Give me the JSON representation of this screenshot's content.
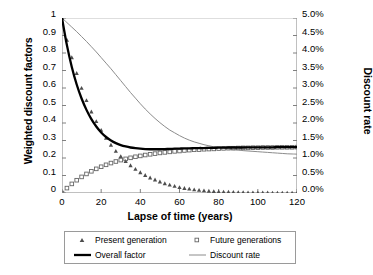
{
  "chart_data": {
    "type": "line",
    "title": "",
    "xlabel": "Lapse of time (years)",
    "ylabel": "Weighted discount factors",
    "y2label": "Discount rate",
    "xlim": [
      0,
      120
    ],
    "ylim": [
      0,
      1
    ],
    "y2lim": [
      0,
      5
    ],
    "grid": false,
    "legend_position": "bottom",
    "xticks": [
      "0",
      "20",
      "40",
      "60",
      "80",
      "100",
      "120"
    ],
    "xtick_values": [
      0,
      20,
      40,
      60,
      80,
      100,
      120
    ],
    "yticks": [
      "0",
      "0.1",
      "0.2",
      "0.3",
      "0.4",
      "0.5",
      "0.6",
      "0.7",
      "0.8",
      "0.9",
      "1"
    ],
    "ytick_values": [
      0,
      0.1,
      0.2,
      0.3,
      0.4,
      0.5,
      0.6,
      0.7,
      0.8,
      0.9,
      1
    ],
    "y2ticks": [
      "0.0%",
      "0.5%",
      "1.0%",
      "1.5%",
      "2.0%",
      "2.5%",
      "3.0%",
      "3.5%",
      "4.0%",
      "4.5%",
      "5.0%"
    ],
    "y2tick_values": [
      0,
      0.5,
      1.0,
      1.5,
      2.0,
      2.5,
      3.0,
      3.5,
      4.0,
      4.5,
      5.0
    ],
    "x": [
      0,
      2.5,
      5,
      7.5,
      10,
      12.5,
      15,
      17.5,
      20,
      22.5,
      25,
      27.5,
      30,
      32.5,
      35,
      37.5,
      40,
      42.5,
      45,
      47.5,
      50,
      52.5,
      55,
      57.5,
      60,
      62.5,
      65,
      67.5,
      70,
      72.5,
      75,
      77.5,
      80,
      82.5,
      85,
      87.5,
      90,
      92.5,
      95,
      97.5,
      100,
      102.5,
      105,
      107.5,
      110,
      112.5,
      115,
      117.5,
      120
    ],
    "series": [
      {
        "name": "Present generation",
        "axis": "left",
        "marker": "triangle",
        "style": "markers",
        "color": "#4d4d4d",
        "values": [
          1.0,
          0.875,
          0.775,
          0.685,
          0.6,
          0.53,
          0.465,
          0.41,
          0.36,
          0.315,
          0.275,
          0.24,
          0.21,
          0.182,
          0.158,
          0.137,
          0.118,
          0.102,
          0.088,
          0.076,
          0.065,
          0.055,
          0.047,
          0.04,
          0.033,
          0.028,
          0.024,
          0.02,
          0.017,
          0.014,
          0.012,
          0.01,
          0.008,
          0.007,
          0.006,
          0.005,
          0.004,
          0.004,
          0.003,
          0.003,
          0.002,
          0.002,
          0.002,
          0.001,
          0.001,
          0.001,
          0.001,
          0.001,
          0.0
        ]
      },
      {
        "name": "Future generations",
        "axis": "left",
        "marker": "square",
        "style": "markers",
        "color": "#666666",
        "values": [
          0.0,
          0.028,
          0.052,
          0.073,
          0.092,
          0.109,
          0.124,
          0.138,
          0.15,
          0.161,
          0.171,
          0.18,
          0.188,
          0.195,
          0.201,
          0.207,
          0.212,
          0.217,
          0.221,
          0.225,
          0.229,
          0.232,
          0.235,
          0.238,
          0.24,
          0.243,
          0.245,
          0.247,
          0.248,
          0.25,
          0.251,
          0.252,
          0.254,
          0.255,
          0.256,
          0.256,
          0.257,
          0.258,
          0.258,
          0.259,
          0.259,
          0.26,
          0.26,
          0.26,
          0.261,
          0.261,
          0.261,
          0.261,
          0.262
        ]
      },
      {
        "name": "Overall factor",
        "axis": "left",
        "marker": "none",
        "style": "thick-line",
        "color": "#000000",
        "values": [
          1.0,
          0.845,
          0.72,
          0.62,
          0.54,
          0.475,
          0.422,
          0.38,
          0.346,
          0.32,
          0.3,
          0.285,
          0.274,
          0.266,
          0.26,
          0.256,
          0.253,
          0.251,
          0.25,
          0.25,
          0.25,
          0.251,
          0.252,
          0.253,
          0.254,
          0.255,
          0.255,
          0.256,
          0.257,
          0.257,
          0.258,
          0.258,
          0.259,
          0.259,
          0.26,
          0.26,
          0.26,
          0.26,
          0.261,
          0.261,
          0.261,
          0.261,
          0.261,
          0.261,
          0.262,
          0.262,
          0.262,
          0.262,
          0.262
        ]
      },
      {
        "name": "Discount rate",
        "axis": "right",
        "marker": "none",
        "style": "thin-line",
        "color": "#8c8c8c",
        "values": [
          5.0,
          4.87,
          4.74,
          4.61,
          4.47,
          4.33,
          4.18,
          4.03,
          3.87,
          3.71,
          3.55,
          3.38,
          3.21,
          3.04,
          2.87,
          2.71,
          2.55,
          2.4,
          2.26,
          2.13,
          2.01,
          1.9,
          1.8,
          1.72,
          1.64,
          1.57,
          1.51,
          1.46,
          1.42,
          1.38,
          1.35,
          1.32,
          1.3,
          1.28,
          1.26,
          1.24,
          1.23,
          1.21,
          1.2,
          1.19,
          1.18,
          1.17,
          1.16,
          1.15,
          1.14,
          1.13,
          1.12,
          1.115,
          1.11
        ]
      }
    ]
  },
  "axes": {
    "x_title": "Lapse of time (years)",
    "y_left_title": "Weighted discount factors",
    "y_right_title": "Discount rate"
  },
  "legend": {
    "items": [
      {
        "label": "Present generation",
        "key": "triangle-marker"
      },
      {
        "label": "Future generations",
        "key": "square-marker"
      },
      {
        "label": "Overall factor",
        "key": "thick-line-swatch"
      },
      {
        "label": "Discount rate",
        "key": "thin-line-swatch"
      }
    ]
  },
  "colors": {
    "present_generation": "#4d4d4d",
    "future_generations": "#666666",
    "overall_factor": "#000000",
    "discount_rate": "#8c8c8c",
    "axis": "#808080",
    "legend_border": "#9a9a9a"
  }
}
